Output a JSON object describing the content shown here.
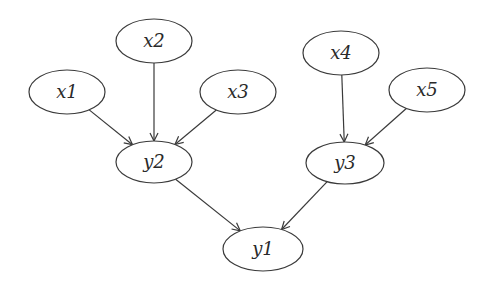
{
  "diagram": {
    "type": "directed-graph",
    "stroke_color": "#3a3a3a",
    "background": "#ffffff",
    "nodes": [
      {
        "id": "x1",
        "label": "x1",
        "cx": 67,
        "cy": 92,
        "rx": 38,
        "ry": 22
      },
      {
        "id": "x2",
        "label": "x2",
        "cx": 154,
        "cy": 41,
        "rx": 38,
        "ry": 22
      },
      {
        "id": "x3",
        "label": "x3",
        "cx": 238,
        "cy": 92,
        "rx": 38,
        "ry": 22
      },
      {
        "id": "x4",
        "label": "x4",
        "cx": 341,
        "cy": 53,
        "rx": 38,
        "ry": 22
      },
      {
        "id": "x5",
        "label": "x5",
        "cx": 427,
        "cy": 90,
        "rx": 38,
        "ry": 22
      },
      {
        "id": "y2",
        "label": "y2",
        "cx": 154,
        "cy": 162,
        "rx": 38,
        "ry": 21
      },
      {
        "id": "y3",
        "label": "y3",
        "cx": 345,
        "cy": 163,
        "rx": 39,
        "ry": 21
      },
      {
        "id": "y1",
        "label": "y1",
        "cx": 263,
        "cy": 249,
        "rx": 40,
        "ry": 22
      }
    ],
    "edges": [
      {
        "from": "x1",
        "to": "y2"
      },
      {
        "from": "x2",
        "to": "y2"
      },
      {
        "from": "x3",
        "to": "y2"
      },
      {
        "from": "x4",
        "to": "y3"
      },
      {
        "from": "x5",
        "to": "y3"
      },
      {
        "from": "y2",
        "to": "y1"
      },
      {
        "from": "y3",
        "to": "y1"
      }
    ]
  }
}
